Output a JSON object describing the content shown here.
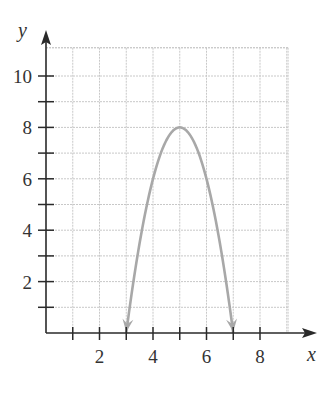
{
  "chart_data": {
    "type": "line",
    "title": "",
    "xlabel": "x",
    "ylabel": "y",
    "xlim": [
      0,
      9
    ],
    "ylim": [
      0,
      11
    ],
    "grid": true,
    "x_ticks": [
      1,
      2,
      3,
      4,
      5,
      6,
      7,
      8
    ],
    "x_tick_labels": [
      "2",
      "4",
      "6",
      "8"
    ],
    "x_tick_label_values": [
      2,
      4,
      6,
      8
    ],
    "y_ticks": [
      1,
      2,
      3,
      4,
      5,
      6,
      7,
      8,
      9,
      10
    ],
    "y_tick_labels": [
      "2",
      "4",
      "6",
      "8",
      "10"
    ],
    "y_tick_label_values": [
      2,
      4,
      6,
      8,
      10
    ],
    "series": [
      {
        "name": "parabola",
        "equation": "y = -2(x - 5)^2 + 8",
        "color": "#a8a8a8",
        "arrows_at_ends": true,
        "x": [
          3,
          3.5,
          4,
          4.5,
          5,
          5.5,
          6,
          6.5,
          7
        ],
        "y": [
          0,
          3.5,
          6,
          7.5,
          8,
          7.5,
          6,
          3.5,
          0
        ]
      }
    ],
    "vertex": [
      5,
      8
    ],
    "x_intercepts": [
      3,
      7
    ]
  },
  "labels": {
    "x_axis": "x",
    "y_axis": "y"
  },
  "colors": {
    "axis": "#2a2a2a",
    "grid": "#c8c8c8",
    "curve": "#a8a8a8",
    "text": "#333333"
  }
}
